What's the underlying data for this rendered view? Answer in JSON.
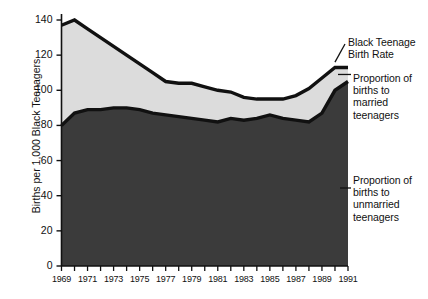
{
  "chart_data": {
    "type": "area",
    "title": "",
    "subtitle": "",
    "xlabel": "",
    "ylabel": "Births per 1,000 Black Teenagers",
    "xlim": [
      1969,
      1991
    ],
    "ylim": [
      0,
      145
    ],
    "yticks": [
      0,
      20,
      40,
      60,
      80,
      100,
      120,
      140
    ],
    "ytick_labels": [
      "0",
      "20",
      "40",
      "60",
      "80",
      "100",
      "120",
      "140"
    ],
    "xticks": [
      1969,
      1970,
      1971,
      1972,
      1973,
      1974,
      1975,
      1976,
      1977,
      1978,
      1979,
      1980,
      1981,
      1982,
      1983,
      1984,
      1985,
      1986,
      1987,
      1988,
      1989,
      1990,
      1991
    ],
    "xtick_labels": [
      "1969",
      "1971",
      "1973",
      "1975",
      "1977",
      "1979",
      "1981",
      "1983",
      "1985",
      "1987",
      "1989",
      "1991"
    ],
    "xtick_label_years": [
      1969,
      1971,
      1973,
      1975,
      1977,
      1979,
      1981,
      1983,
      1985,
      1987,
      1989,
      1991
    ],
    "grid": false,
    "legend_position": "right-annotations",
    "stacked": true,
    "x": [
      1969,
      1970,
      1971,
      1972,
      1973,
      1974,
      1975,
      1976,
      1977,
      1978,
      1979,
      1980,
      1981,
      1982,
      1983,
      1984,
      1985,
      1986,
      1987,
      1988,
      1989,
      1990,
      1991
    ],
    "series": [
      {
        "name": "Proportion of births to unmarried teenagers",
        "role": "lower-band",
        "color": "#3b3b3b",
        "values": [
          80,
          87,
          89,
          89,
          90,
          90,
          89,
          87,
          86,
          85,
          84,
          83,
          82,
          84,
          83,
          84,
          86,
          84,
          83,
          82,
          87,
          100,
          105
        ]
      },
      {
        "name": "Black Teenage Birth Rate",
        "role": "total-upper-line",
        "color": "#dcdcdc",
        "values": [
          137,
          140,
          135,
          130,
          125,
          120,
          115,
          110,
          105,
          104,
          104,
          102,
          100,
          99,
          96,
          95,
          95,
          95,
          97,
          101,
          107,
          113,
          113
        ]
      }
    ],
    "annotations": [
      {
        "name": "black-teenage-birth-rate",
        "text": "Black Teenage\nBirth Rate",
        "target_year": 1990,
        "target_value": 113
      },
      {
        "name": "proportion-married",
        "text": "Proportion of\nbirths to\nmarried\nteenagers",
        "target_year": 1991,
        "target_value": 109
      },
      {
        "name": "proportion-unmarried",
        "text": "Proportion of\nbirths to\nunmarried\nteenagers",
        "target_year": 1991,
        "target_value": 55
      }
    ]
  },
  "colors": {
    "unmarried_band": "#3b3b3b",
    "married_band": "#dcdcdc",
    "line": "#111111",
    "axis": "#111111",
    "background": "#ffffff",
    "text": "#111111"
  },
  "axis": {
    "ylabel": "Births per 1,000 Black Teenagers"
  },
  "annotations": {
    "birth_rate": "Black Teenage\nBirth Rate",
    "married": "Proportion of\nbirths to\nmarried\nteenagers",
    "unmarried": "Proportion of\nbirths to\nunmarried\nteenagers"
  }
}
